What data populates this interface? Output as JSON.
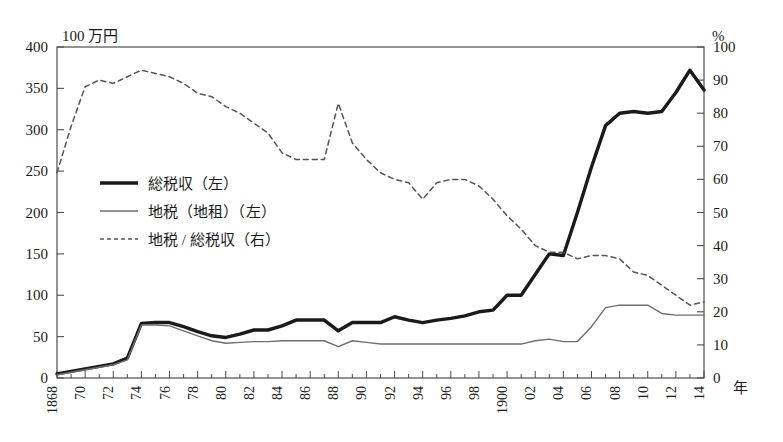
{
  "chart_data": {
    "type": "line",
    "title": "",
    "xlabel": "年",
    "left_axis_unit": "100 万円",
    "right_axis_unit": "%",
    "grid": false,
    "legend_position": "inside-left",
    "xlim": [
      1868,
      1914
    ],
    "left_ylim": [
      0,
      400
    ],
    "right_ylim": [
      0,
      100
    ],
    "left_yticks": [
      0,
      50,
      100,
      150,
      200,
      250,
      300,
      350,
      400
    ],
    "right_yticks": [
      0,
      10,
      20,
      30,
      40,
      50,
      60,
      70,
      80,
      90,
      100
    ],
    "x": [
      1868,
      1869,
      1870,
      1871,
      1872,
      1873,
      1874,
      1875,
      1876,
      1877,
      1878,
      1879,
      1880,
      1881,
      1882,
      1883,
      1884,
      1885,
      1886,
      1887,
      1888,
      1889,
      1890,
      1891,
      1892,
      1893,
      1894,
      1895,
      1896,
      1897,
      1898,
      1899,
      1900,
      1901,
      1902,
      1903,
      1904,
      1905,
      1906,
      1907,
      1908,
      1909,
      1910,
      1911,
      1912,
      1913,
      1914
    ],
    "xticklabels": [
      "1868",
      "",
      "70",
      "",
      "72",
      "",
      "74",
      "",
      "76",
      "",
      "78",
      "",
      "80",
      "",
      "82",
      "",
      "84",
      "",
      "86",
      "",
      "88",
      "",
      "90",
      "",
      "92",
      "",
      "94",
      "",
      "96",
      "",
      "98",
      "",
      "1900",
      "",
      "02",
      "",
      "04",
      "",
      "06",
      "",
      "08",
      "",
      "10",
      "",
      "12",
      "",
      "14"
    ],
    "series": [
      {
        "name": "総税収（左）",
        "axis": "left",
        "style": "solid-thick",
        "color": "#1a1a1a",
        "values": [
          5,
          8,
          11,
          14,
          17,
          24,
          66,
          67,
          67,
          62,
          56,
          51,
          49,
          53,
          58,
          58,
          63,
          70,
          70,
          70,
          57,
          67,
          67,
          67,
          74,
          70,
          67,
          70,
          72,
          75,
          80,
          82,
          100,
          100,
          125,
          150,
          148,
          200,
          255,
          305,
          320,
          322,
          320,
          322,
          345,
          372,
          348
        ]
      },
      {
        "name": "地税（地租）（左）",
        "axis": "left",
        "style": "solid-thin",
        "color": "#6e6e6e",
        "values": [
          4,
          7,
          10,
          13,
          16,
          22,
          64,
          64,
          63,
          57,
          51,
          45,
          42,
          43,
          44,
          44,
          45,
          45,
          45,
          45,
          38,
          45,
          43,
          41,
          41,
          41,
          41,
          41,
          41,
          41,
          41,
          41,
          41,
          41,
          45,
          47,
          44,
          44,
          62,
          85,
          88,
          88,
          88,
          78,
          76,
          76,
          76
        ]
      },
      {
        "name": "地税 / 総税収（右）",
        "axis": "right",
        "style": "dashed",
        "color": "#555555",
        "values": [
          62,
          76,
          88,
          90,
          89,
          91,
          93,
          92,
          91,
          89,
          86,
          85,
          82,
          80,
          77,
          74,
          68,
          66,
          66,
          66,
          83,
          71,
          66,
          62,
          60,
          59,
          54,
          59,
          60,
          60,
          58,
          54,
          49,
          45,
          40,
          38,
          38,
          36,
          37,
          37,
          36,
          32,
          31,
          28,
          25,
          22,
          23
        ]
      }
    ]
  },
  "legend": {
    "items": [
      {
        "label": "総税収（左）",
        "style": "solid-thick"
      },
      {
        "label": "地税（地租）（左）",
        "style": "solid-thin"
      },
      {
        "label": "地税 / 総税収（右）",
        "style": "dashed"
      }
    ]
  },
  "axes": {
    "left_unit_label": "100 万円",
    "right_unit_label": "%",
    "x_unit_label": "年"
  }
}
